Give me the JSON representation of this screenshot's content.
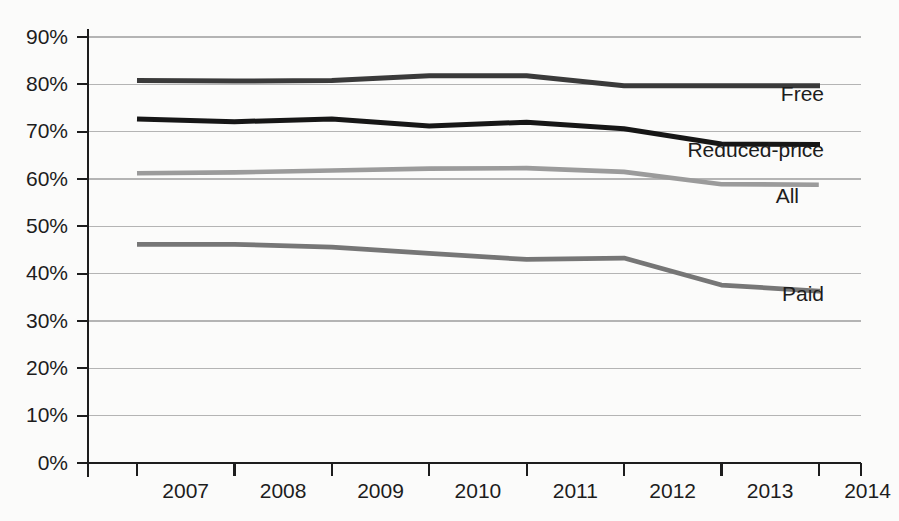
{
  "chart_data": {
    "type": "line",
    "title": "",
    "subtitle": "",
    "xlabel": "",
    "ylabel": "",
    "categories": [
      "2007",
      "2008",
      "2009",
      "2010",
      "2011",
      "2012",
      "2013",
      "2014"
    ],
    "x_tick_labels": [
      "2007",
      "2008",
      "2009",
      "2010",
      "2011",
      "2012",
      "2013",
      "2014"
    ],
    "y_tick_labels": [
      "0%",
      "10%",
      "20%",
      "30%",
      "40%",
      "50%",
      "60%",
      "70%",
      "80%",
      "90%"
    ],
    "y_tick_values": [
      0,
      10,
      20,
      30,
      40,
      50,
      60,
      70,
      80,
      90
    ],
    "ylim": [
      0,
      90
    ],
    "grid": "horizontal",
    "legend_position": "inline-end-of-line",
    "background_color": "#fbfbfa",
    "series": [
      {
        "name": "Free",
        "label": "Free",
        "color": "#3a3a3a",
        "stroke_width": 5.0,
        "values": [
          80.8,
          80.7,
          80.8,
          81.8,
          81.8,
          79.7,
          79.7,
          79.7
        ]
      },
      {
        "name": "Reduced-price",
        "label": "Reduced-price",
        "color": "#161616",
        "stroke_width": 5.0,
        "values": [
          72.7,
          72.1,
          72.7,
          71.2,
          72.0,
          70.6,
          67.4,
          67.3
        ]
      },
      {
        "name": "All",
        "label": "All",
        "color": "#9b9b9b",
        "stroke_width": 4.6,
        "values": [
          61.2,
          61.4,
          61.8,
          62.2,
          62.3,
          61.5,
          58.9,
          58.8
        ]
      },
      {
        "name": "Paid",
        "label": "Paid",
        "color": "#767676",
        "stroke_width": 4.8,
        "values": [
          46.2,
          46.2,
          45.6,
          44.3,
          43.0,
          43.3,
          37.6,
          36.3
        ]
      }
    ]
  }
}
